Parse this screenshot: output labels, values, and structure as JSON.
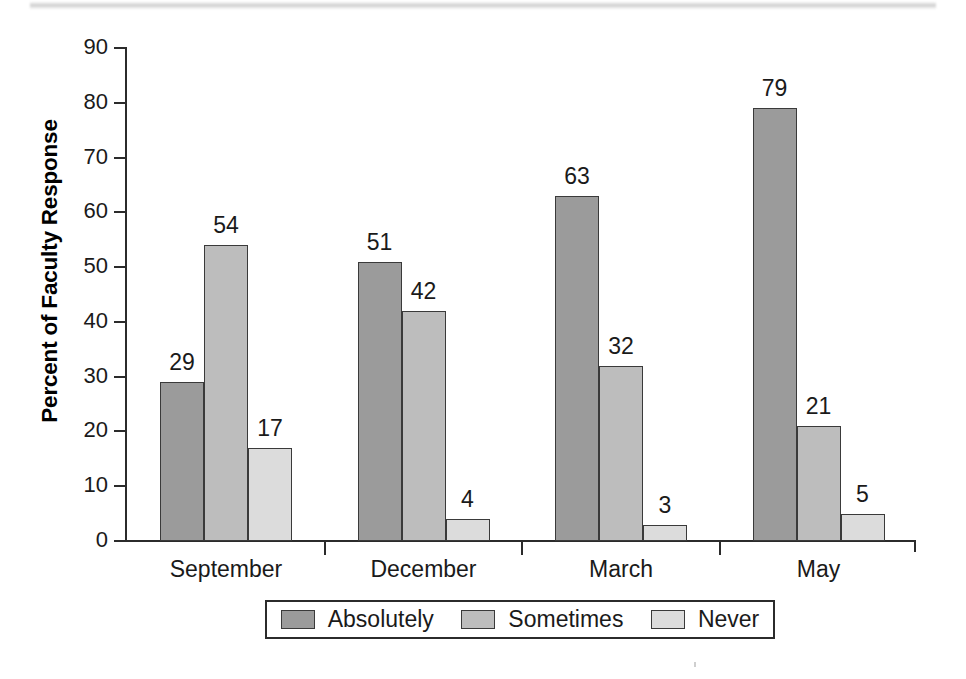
{
  "chart_data": {
    "type": "bar",
    "title": "",
    "xlabel": "",
    "ylabel": "Percent of Faculty Response",
    "ylim": [
      0,
      90
    ],
    "y_ticks": [
      0,
      10,
      20,
      30,
      40,
      50,
      60,
      70,
      80,
      90
    ],
    "grid": false,
    "legend_position": "bottom",
    "categories": [
      "September",
      "December",
      "March",
      "May"
    ],
    "series": [
      {
        "name": "Absolutely",
        "color": "#9b9b9b",
        "values": [
          29,
          51,
          63,
          79
        ]
      },
      {
        "name": "Sometimes",
        "color": "#bdbdbd",
        "values": [
          54,
          42,
          32,
          21
        ]
      },
      {
        "name": "Never",
        "color": "#dcdcdc",
        "values": [
          17,
          4,
          3,
          5
        ]
      }
    ],
    "value_labels": [
      "29",
      "54",
      "17",
      "51",
      "42",
      "4",
      "63",
      "32",
      "3",
      "79",
      "21",
      "5"
    ]
  },
  "axes": {
    "y_tick_labels": [
      "90",
      "80",
      "70",
      "60",
      "50",
      "40",
      "30",
      "20",
      "10",
      "0"
    ],
    "y_title": "Percent of Faculty Response",
    "x_tick_labels": [
      "September",
      "December",
      "March",
      "May"
    ]
  },
  "legend": {
    "entries": [
      {
        "label": "Absolutely",
        "color": "#9b9b9b"
      },
      {
        "label": "Sometimes",
        "color": "#bdbdbd"
      },
      {
        "label": "Never",
        "color": "#dcdcdc"
      }
    ]
  }
}
